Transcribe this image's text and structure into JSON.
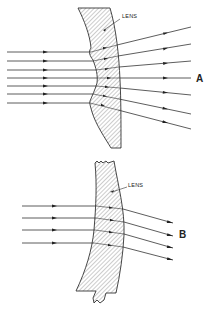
{
  "figure": {
    "panels": [
      {
        "id": "A",
        "label": "A",
        "lens_label": "LENS",
        "description": "Parallel rays enter a lens with a concave irregular front surface and diverge after exiting",
        "incoming_rays": 7,
        "outgoing_behavior": "diverging"
      },
      {
        "id": "B",
        "label": "B",
        "lens_label": "LENS",
        "description": "Parallel rays enter a curved lens section and are deflected downward in parallel",
        "incoming_rays": 4,
        "outgoing_behavior": "deflected-parallel"
      }
    ],
    "colors": {
      "ink": "#333333",
      "background": "#ffffff"
    }
  }
}
